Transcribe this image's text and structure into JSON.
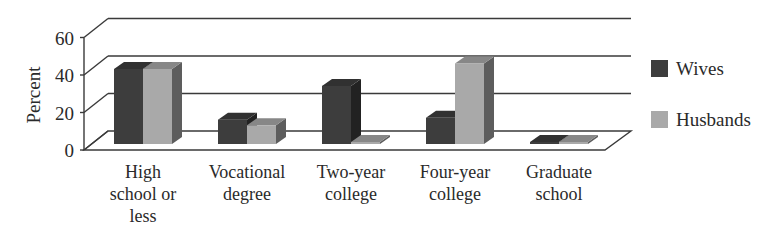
{
  "chart_data": {
    "type": "bar",
    "style": "3d-clustered-column",
    "title": "",
    "xlabel": "",
    "ylabel": "Percent",
    "ylim": [
      0,
      60
    ],
    "yticks": [
      0,
      20,
      40,
      60
    ],
    "grid": true,
    "legend_position": "right",
    "categories": [
      [
        "High",
        "school or",
        "less"
      ],
      [
        "Vocational",
        "degree"
      ],
      [
        "Two-year",
        "college"
      ],
      [
        "Four-year",
        "college"
      ],
      [
        "Graduate",
        "school"
      ]
    ],
    "series": [
      {
        "name": "Wives",
        "color": "#3d3d3d",
        "values": [
          40,
          13,
          31,
          14,
          1
        ]
      },
      {
        "name": "Husbands",
        "color": "#a9a9a9",
        "values": [
          40,
          10,
          1,
          43,
          1
        ]
      }
    ]
  }
}
